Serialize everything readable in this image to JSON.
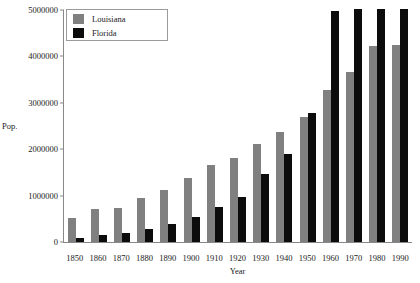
{
  "chart_data": {
    "type": "bar",
    "title": "",
    "xlabel": "Year",
    "ylabel": "Pop.",
    "ylim": [
      0,
      5000000
    ],
    "yticks": [
      0,
      1000000,
      2000000,
      3000000,
      4000000,
      5000000
    ],
    "ytick_labels": [
      "0",
      "1000000",
      "2000000",
      "3000000",
      "4000000",
      "5000000"
    ],
    "grid": false,
    "legend_position": "top-left",
    "categories": [
      "1850",
      "1860",
      "1870",
      "1880",
      "1890",
      "1900",
      "1910",
      "1920",
      "1930",
      "1940",
      "1950",
      "1960",
      "1970",
      "1980",
      "1990"
    ],
    "series": [
      {
        "name": "Louisiana",
        "color": "#808080",
        "values": [
          518000,
          708000,
          727000,
          940000,
          1119000,
          1382000,
          1656000,
          1799000,
          2102000,
          2364000,
          2684000,
          3257000,
          3641000,
          4206000,
          4220000
        ]
      },
      {
        "name": "Florida",
        "color": "#0c0c0c",
        "values": [
          87000,
          140000,
          188000,
          269000,
          391000,
          529000,
          753000,
          968000,
          1468000,
          1897000,
          2771000,
          4952000,
          6789000,
          9746000,
          12938000
        ]
      }
    ]
  },
  "legend": {
    "items": [
      {
        "label": "Louisiana",
        "swatch": "#808080"
      },
      {
        "label": "Florida",
        "swatch": "#0c0c0c"
      }
    ]
  },
  "axes": {
    "y_label": "Pop.",
    "x_label": "Year"
  }
}
